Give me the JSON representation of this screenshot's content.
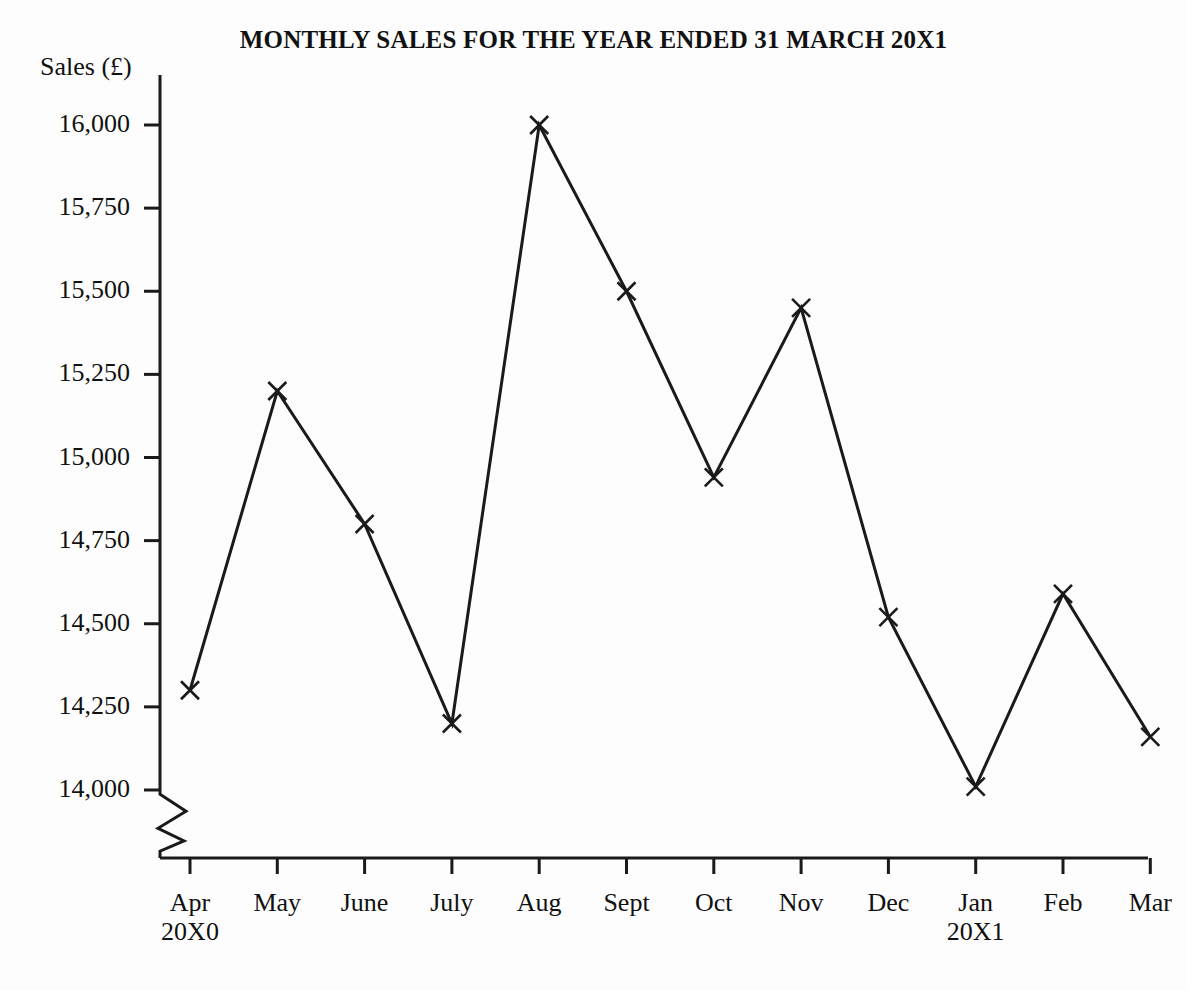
{
  "chart_data": {
    "type": "line",
    "title": "MONTHLY SALES FOR THE YEAR ENDED 31 MARCH 20X1",
    "xlabel": "",
    "ylabel": "Sales (£)",
    "categories": [
      "Apr",
      "May",
      "June",
      "July",
      "Aug",
      "Sept",
      "Oct",
      "Nov",
      "Dec",
      "Jan",
      "Feb",
      "Mar"
    ],
    "category_sublabels": [
      "20X0",
      "",
      "",
      "",
      "",
      "",
      "",
      "",
      "",
      "20X1",
      "",
      ""
    ],
    "values": [
      14300,
      15200,
      14800,
      14200,
      16000,
      15500,
      14940,
      15450,
      14520,
      14010,
      14590,
      14160
    ],
    "ytick_labels": [
      "16,000",
      "15,750",
      "15,500",
      "15,250",
      "15,000",
      "14,750",
      "14,500",
      "14,250",
      "14,000"
    ],
    "ytick_values": [
      16000,
      15750,
      15500,
      15250,
      15000,
      14750,
      14500,
      14250,
      14000
    ],
    "ylim": [
      14000,
      16000
    ],
    "axis_break": true,
    "grid": false,
    "legend": false,
    "marker": "x",
    "line_color": "#1a1a1a",
    "axis_color": "#1a1a1a",
    "background": "#fdfdfd"
  }
}
